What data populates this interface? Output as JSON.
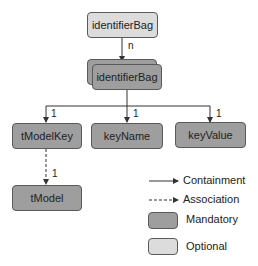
{
  "nodes": {
    "top": {
      "label": "identifierBag",
      "kind": "optional"
    },
    "bag": {
      "label": "identifierBag",
      "kind": "mandatory",
      "multiple": true
    },
    "tModelKey": {
      "label": "tModelKey",
      "kind": "mandatory"
    },
    "keyName": {
      "label": "keyName",
      "kind": "mandatory"
    },
    "keyValue": {
      "label": "keyValue",
      "kind": "mandatory"
    },
    "tModel": {
      "label": "tModel",
      "kind": "mandatory"
    }
  },
  "edges": {
    "top_to_bag": {
      "type": "containment",
      "cardinality": "n"
    },
    "bag_to_tModelKey": {
      "type": "containment",
      "cardinality": "1"
    },
    "bag_to_keyName": {
      "type": "containment",
      "cardinality": "1"
    },
    "bag_to_keyValue": {
      "type": "containment",
      "cardinality": "1"
    },
    "tModelKey_to_tModel": {
      "type": "association",
      "cardinality": "1"
    }
  },
  "legend": {
    "containment": "Containment",
    "association": "Association",
    "mandatory": "Mandatory",
    "optional": "Optional"
  },
  "colors": {
    "mandatory": "#9e9e9e",
    "optional": "#dcdcdc",
    "line": "#333333"
  }
}
